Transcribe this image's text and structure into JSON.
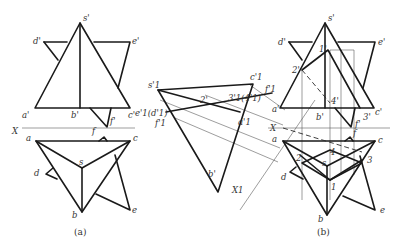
{
  "figure": {
    "panel_a": {
      "caption": "(a)",
      "frontal_labels": {
        "s": "s'",
        "d": "d'",
        "e": "e'",
        "a": "a'",
        "b": "b'",
        "c": "c'",
        "f": "f'"
      },
      "axis_label": "X",
      "plan_labels": {
        "a": "a",
        "c": "c",
        "s": "s",
        "b": "b",
        "d": "d",
        "e": "e",
        "f": "f"
      }
    },
    "auxiliary": {
      "labels": {
        "s1": "s'1",
        "c1": "c'1",
        "p34": "3'1(4'1)",
        "f1top": "f'1",
        "e1d1": "e'1(d'1)",
        "p2": "2'",
        "f1": "f'1",
        "a1": "a'1",
        "b": "b'",
        "x1": "X1"
      }
    },
    "panel_b": {
      "caption": "(b)",
      "frontal_labels": {
        "s": "s'",
        "d": "d'",
        "e": "e'",
        "a": "a'",
        "b": "b'",
        "c": "c'",
        "f": "f'",
        "p1": "1'",
        "p2": "2'",
        "p3": "3'",
        "p4": "4'"
      },
      "axis_label": "X",
      "plan_labels": {
        "a": "a",
        "c": "c",
        "s": "s",
        "b": "b",
        "d": "d",
        "e": "e",
        "f": "f",
        "p1": "1",
        "p2": "2",
        "p3": "3",
        "p4": "4"
      }
    }
  }
}
